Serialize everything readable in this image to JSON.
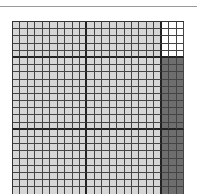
{
  "diagram": {
    "type": "shaded-grid",
    "columns": 23,
    "rows": 24,
    "column_groups": [
      10,
      10,
      3
    ],
    "row_groups": [
      5,
      10,
      9
    ],
    "regions": [
      {
        "name": "top-left-block",
        "rows": [
          0,
          5
        ],
        "cols": [
          0,
          20
        ],
        "fill": "light-gray"
      },
      {
        "name": "top-right-block",
        "rows": [
          0,
          5
        ],
        "cols": [
          20,
          23
        ],
        "fill": "white"
      },
      {
        "name": "main-block",
        "rows": [
          5,
          24
        ],
        "cols": [
          0,
          20
        ],
        "fill": "light-gray"
      },
      {
        "name": "right-column-block",
        "rows": [
          5,
          24
        ],
        "cols": [
          20,
          23
        ],
        "fill": "dark-gray"
      }
    ],
    "colors": {
      "light-gray": "#d6d6d6",
      "white": "#ffffff",
      "dark-gray": "#6e6e6e",
      "grid_line": "#444444",
      "thick_line": "#222222"
    }
  }
}
